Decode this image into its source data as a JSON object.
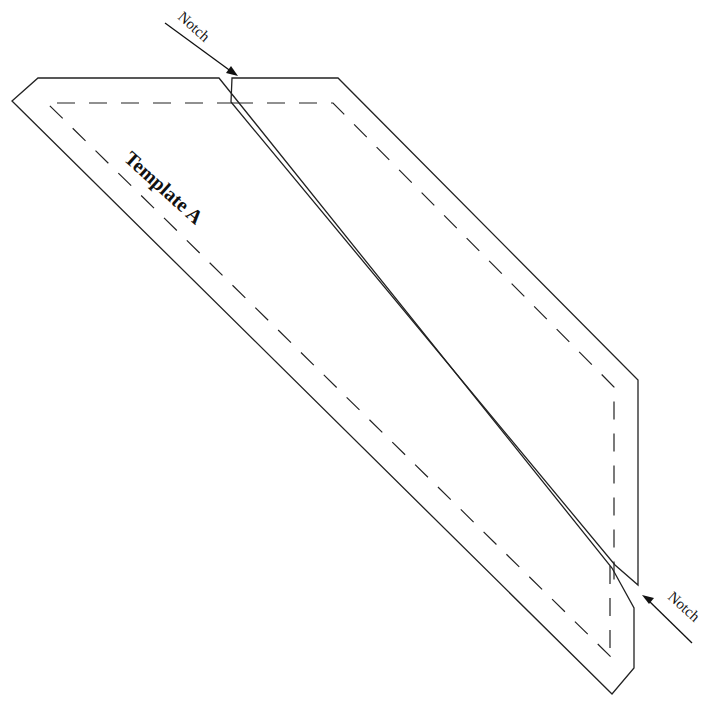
{
  "diagram": {
    "title": "Template A",
    "notch_top_label": "Notch",
    "notch_bottom_label": "Notch",
    "pieces": [
      {
        "name": "left-piece",
        "line_style": "solid"
      },
      {
        "name": "right-piece",
        "line_style": "solid"
      }
    ],
    "seam_allowance_style": "dashed",
    "colors": {
      "stroke": "#222222",
      "background": "#ffffff"
    }
  }
}
